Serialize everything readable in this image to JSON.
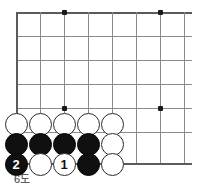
{
  "diagram": {
    "caption": "6도",
    "type": "go-board-diagram",
    "corner": "bottom-left",
    "colors": {
      "grid": "#8a8a8a",
      "grid_edge": "#5b5b5b",
      "black_stone": "#101010",
      "white_stone": "#ffffff",
      "background": "#ffffff"
    },
    "board": {
      "columns": 8,
      "rows": 7,
      "spacing_px": 24,
      "origin_x": 16,
      "origin_y": 12
    },
    "star_points": [
      {
        "name": "star-point-top-left",
        "x": 64,
        "y": 12
      },
      {
        "name": "star-point-top-right",
        "x": 160,
        "y": 12
      },
      {
        "name": "star-point-bottom-left",
        "x": 64,
        "y": 108
      },
      {
        "name": "star-point-bottom-right",
        "x": 160,
        "y": 108
      }
    ],
    "grid_lines": {
      "horizontal_y": [
        12,
        36,
        60,
        84,
        108,
        132,
        163
      ],
      "vertical_x": [
        16,
        40,
        64,
        88,
        112,
        136,
        160,
        184
      ]
    },
    "stones": [
      {
        "name": "white-stone-r1c1",
        "color": "white",
        "label": "",
        "x": 16,
        "y": 124
      },
      {
        "name": "white-stone-r1c2",
        "color": "white",
        "label": "",
        "x": 40,
        "y": 124
      },
      {
        "name": "white-stone-r1c3",
        "color": "white",
        "label": "",
        "x": 64,
        "y": 124
      },
      {
        "name": "white-stone-r1c4",
        "color": "white",
        "label": "",
        "x": 88,
        "y": 124
      },
      {
        "name": "white-stone-r1c5",
        "color": "white",
        "label": "",
        "x": 112,
        "y": 124
      },
      {
        "name": "black-stone-r2c1",
        "color": "black",
        "label": "",
        "x": 16,
        "y": 144
      },
      {
        "name": "black-stone-r2c2",
        "color": "black",
        "label": "",
        "x": 40,
        "y": 144
      },
      {
        "name": "black-stone-r2c3",
        "color": "black",
        "label": "",
        "x": 64,
        "y": 144
      },
      {
        "name": "black-stone-r2c4",
        "color": "black",
        "label": "",
        "x": 88,
        "y": 144
      },
      {
        "name": "white-stone-r2c5",
        "color": "white",
        "label": "",
        "x": 112,
        "y": 144
      },
      {
        "name": "black-stone-move-2",
        "color": "black",
        "label": "2",
        "x": 16,
        "y": 164
      },
      {
        "name": "white-stone-r3c2",
        "color": "white",
        "label": "",
        "x": 40,
        "y": 164
      },
      {
        "name": "white-stone-move-1",
        "color": "white",
        "label": "1",
        "x": 64,
        "y": 164
      },
      {
        "name": "black-stone-r3c4",
        "color": "black",
        "label": "",
        "x": 88,
        "y": 164
      },
      {
        "name": "white-stone-r3c5",
        "color": "white",
        "label": "",
        "x": 112,
        "y": 164
      }
    ]
  }
}
